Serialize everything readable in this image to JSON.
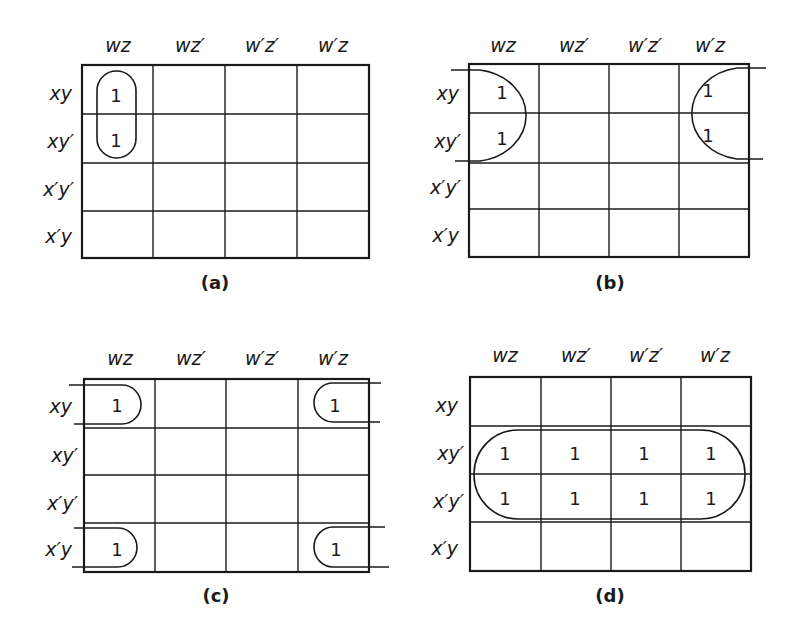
{
  "figure": {
    "column_headers": [
      "wz",
      "wz′",
      "w′z′",
      "w′z"
    ],
    "row_headers": [
      "xy",
      "xy′",
      "x′y′",
      "x′y"
    ],
    "maps": [
      {
        "id": "a",
        "caption": "(a)",
        "cells": [
          [
            "1",
            "",
            "",
            ""
          ],
          [
            "1",
            "",
            "",
            ""
          ],
          [
            "",
            "",
            "",
            ""
          ],
          [
            "",
            "",
            "",
            ""
          ]
        ],
        "groupings": [
          "vertical loop around column wz, rows xy and xy′"
        ]
      },
      {
        "id": "b",
        "caption": "(b)",
        "cells": [
          [
            "1",
            "",
            "",
            "1"
          ],
          [
            "1",
            "",
            "",
            "1"
          ],
          [
            "",
            "",
            "",
            ""
          ],
          [
            "",
            "",
            "",
            ""
          ]
        ],
        "groupings": [
          "wrap-around loop joining columns wz and w′z for rows xy and xy′"
        ]
      },
      {
        "id": "c",
        "caption": "(c)",
        "cells": [
          [
            "1",
            "",
            "",
            "1"
          ],
          [
            "",
            "",
            "",
            ""
          ],
          [
            "",
            "",
            "",
            ""
          ],
          [
            "1",
            "",
            "",
            "1"
          ]
        ],
        "groupings": [
          "four-corner wrap-around loop"
        ]
      },
      {
        "id": "d",
        "caption": "(d)",
        "cells": [
          [
            "",
            "",
            "",
            ""
          ],
          [
            "1",
            "1",
            "1",
            "1"
          ],
          [
            "1",
            "1",
            "1",
            "1"
          ],
          [
            "",
            "",
            "",
            ""
          ]
        ],
        "groupings": [
          "horizontal loop around rows xy′ and x′y′ across all columns"
        ]
      }
    ]
  }
}
